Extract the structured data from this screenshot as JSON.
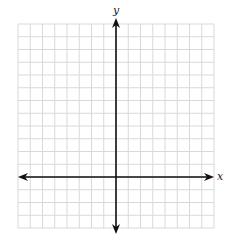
{
  "graph": {
    "x_axis_label": "x",
    "y_axis_label": "y",
    "grid": {
      "left": 18,
      "top": 24,
      "right": 214,
      "bottom": 228,
      "columns": 16,
      "rows": 16,
      "origin_col": 8,
      "origin_row": 12,
      "grid_color": "#d9d9d9",
      "axis_color": "#111111"
    }
  }
}
